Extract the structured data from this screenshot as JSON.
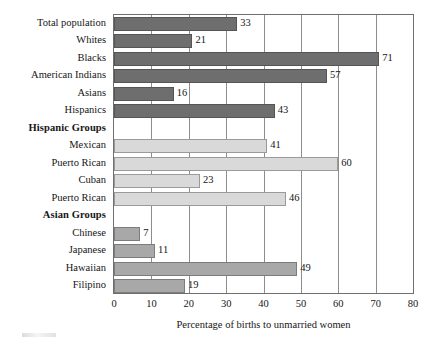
{
  "chart_data": {
    "type": "bar",
    "orientation": "horizontal",
    "title": "",
    "xlabel": "Percentage of births to unmarried women",
    "ylabel": "",
    "xlim": [
      0,
      80
    ],
    "xticks": [
      0,
      10,
      20,
      30,
      40,
      50,
      60,
      70,
      80
    ],
    "xtick_labels": [
      "0",
      "10",
      "20",
      "30",
      "40",
      "50",
      "60",
      "70",
      "80"
    ],
    "grid": "vertical",
    "legend": "none",
    "categories": [
      "Total population",
      "Whites",
      "Blacks",
      "American Indians",
      "Asians",
      "Hispanics",
      "Hispanic Groups",
      "Mexican",
      "Puerto Rican",
      "Cuban",
      "Puerto Rican",
      "Asian Groups",
      "Chinese",
      "Japanese",
      "Hawaiian",
      "Filipino"
    ],
    "values": [
      33,
      21,
      71,
      57,
      16,
      43,
      null,
      41,
      60,
      23,
      46,
      null,
      7,
      11,
      49,
      19
    ],
    "rows": [
      {
        "label": "Total population",
        "value": 33,
        "value_label": "33",
        "is_header": false,
        "tone": "dark"
      },
      {
        "label": "Whites",
        "value": 21,
        "value_label": "21",
        "is_header": false,
        "tone": "dark"
      },
      {
        "label": "Blacks",
        "value": 71,
        "value_label": "71",
        "is_header": false,
        "tone": "dark"
      },
      {
        "label": "American Indians",
        "value": 57,
        "value_label": "57",
        "is_header": false,
        "tone": "dark"
      },
      {
        "label": "Asians",
        "value": 16,
        "value_label": "16",
        "is_header": false,
        "tone": "dark"
      },
      {
        "label": "Hispanics",
        "value": 43,
        "value_label": "43",
        "is_header": false,
        "tone": "dark"
      },
      {
        "label": "Hispanic Groups",
        "value": null,
        "value_label": "",
        "is_header": true,
        "tone": "none"
      },
      {
        "label": "Mexican",
        "value": 41,
        "value_label": "41",
        "is_header": false,
        "tone": "light"
      },
      {
        "label": "Puerto Rican",
        "value": 60,
        "value_label": "60",
        "is_header": false,
        "tone": "light"
      },
      {
        "label": "Cuban",
        "value": 23,
        "value_label": "23",
        "is_header": false,
        "tone": "light"
      },
      {
        "label": "Puerto Rican",
        "value": 46,
        "value_label": "46",
        "is_header": false,
        "tone": "light"
      },
      {
        "label": "Asian Groups",
        "value": null,
        "value_label": "",
        "is_header": true,
        "tone": "none"
      },
      {
        "label": "Chinese",
        "value": 7,
        "value_label": "7",
        "is_header": false,
        "tone": "mid"
      },
      {
        "label": "Japanese",
        "value": 11,
        "value_label": "11",
        "is_header": false,
        "tone": "mid"
      },
      {
        "label": "Hawaiian",
        "value": 49,
        "value_label": "49",
        "is_header": false,
        "tone": "mid"
      },
      {
        "label": "Filipino",
        "value": 19,
        "value_label": "19",
        "is_header": false,
        "tone": "mid"
      }
    ],
    "colors": {
      "dark": "#6e6e6e",
      "light": "#d9d9d9",
      "mid": "#a8a8a8",
      "axis": "#6f6f6f",
      "grid": "#8d8d8d",
      "text": "#161616",
      "background": "#ffffff"
    }
  }
}
